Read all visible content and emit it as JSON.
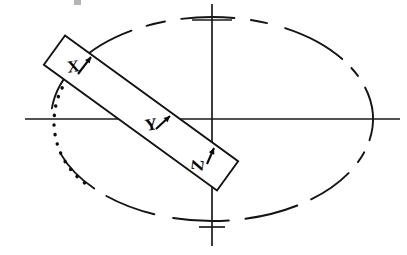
{
  "figure": {
    "width": 407,
    "height": 255,
    "background_color": "#ffffff",
    "ink_color": "#111111"
  },
  "axes": {
    "name": "cartesian-axis-cross",
    "origin": {
      "x": 212,
      "y": 119
    },
    "horizontal": {
      "x1": 25,
      "y1": 119,
      "x2": 400,
      "y2": 119
    },
    "vertical": {
      "x1": 212,
      "y1": 4,
      "x2": 212,
      "y2": 246
    },
    "ticks": [
      {
        "name": "tick-top",
        "x": 212,
        "y": 20,
        "half_width": 20,
        "orientation": "horizontal"
      },
      {
        "name": "tick-bottom",
        "x": 212,
        "y": 227,
        "half_width": 13,
        "orientation": "horizontal"
      }
    ]
  },
  "ellipse": {
    "name": "dashed-ellipse",
    "center_x": 212,
    "center_y": 119,
    "radius_x": 161,
    "radius_y": 102,
    "style": "dashed",
    "stroke_width": 1.9,
    "dash_segments": [
      {
        "start_deg": 174,
        "end_deg": 120
      },
      {
        "start_deg": 114,
        "end_deg": 107
      },
      {
        "start_deg": 101,
        "end_deg": 82
      },
      {
        "start_deg": 76,
        "end_deg": 70
      },
      {
        "start_deg": 63,
        "end_deg": 36
      },
      {
        "start_deg": 30,
        "end_deg": 25
      },
      {
        "start_deg": 18,
        "end_deg": -12
      },
      {
        "start_deg": -19,
        "end_deg": -25
      },
      {
        "start_deg": -32,
        "end_deg": -52
      },
      {
        "start_deg": -58,
        "end_deg": -78
      },
      {
        "start_deg": -84,
        "end_deg": -104
      },
      {
        "start_deg": -111,
        "end_deg": -131
      },
      {
        "start_deg": -137,
        "end_deg": -160
      }
    ]
  },
  "dotted_arc": {
    "name": "dotted-arc",
    "center_x": 130,
    "center_y": 122,
    "radius": 76,
    "start_deg": 146,
    "end_deg": 237,
    "style": "dotted",
    "dot_spacing": 9.4,
    "stroke_width": 3.4
  },
  "bar": {
    "name": "rotated-rectangular-bar",
    "center_x": 141,
    "center_y": 113,
    "length": 214,
    "width": 36,
    "rotation_deg": 36,
    "fill": "#ffffff",
    "stroke": "#111111"
  },
  "labels": [
    {
      "id": "x",
      "name": "axis-label-x",
      "text": "X",
      "x": 74,
      "y": 72,
      "rotation_deg": -8,
      "arrow": {
        "name": "x-callout-arrow",
        "x1": 78,
        "y1": 74,
        "x2": 91,
        "y2": 57,
        "head_size": 6
      }
    },
    {
      "id": "y",
      "name": "axis-label-y",
      "text": "Y",
      "x": 152,
      "y": 130,
      "rotation_deg": -10,
      "arrow": {
        "name": "y-callout-arrow",
        "x1": 156,
        "y1": 129,
        "x2": 170,
        "y2": 116,
        "head_size": 6
      }
    },
    {
      "id": "z",
      "name": "axis-label-z",
      "text": "Z",
      "x": 203,
      "y": 166,
      "rotation_deg": -82,
      "arrow": {
        "name": "z-callout-arrow",
        "x1": 207,
        "y1": 164,
        "x2": 214,
        "y2": 148,
        "head_size": 6
      }
    }
  ],
  "artifact": {
    "name": "scan-artifact",
    "x": 74,
    "y": 0,
    "width": 7,
    "height": 5
  }
}
